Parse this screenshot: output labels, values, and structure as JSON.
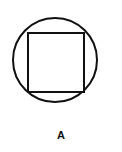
{
  "canvas": {
    "width": 122,
    "height": 152,
    "background_color": "#ffffff"
  },
  "watermark": {
    "top_text": "",
    "bottom_text": "",
    "color": "#fcfcfc",
    "note": "near-white illegible watermark text"
  },
  "figure": {
    "label": "A",
    "label_color": "#111111",
    "stroke_color": "#111111",
    "fill_color": "#ffffff",
    "shapes": [
      {
        "name": "circle",
        "type": "circle",
        "cx": 55,
        "cy": 60,
        "r": 42,
        "stroke_width": 2
      },
      {
        "name": "square",
        "type": "rect",
        "x": 28,
        "y": 33,
        "width": 56,
        "height": 59,
        "stroke_width": 2
      }
    ]
  }
}
